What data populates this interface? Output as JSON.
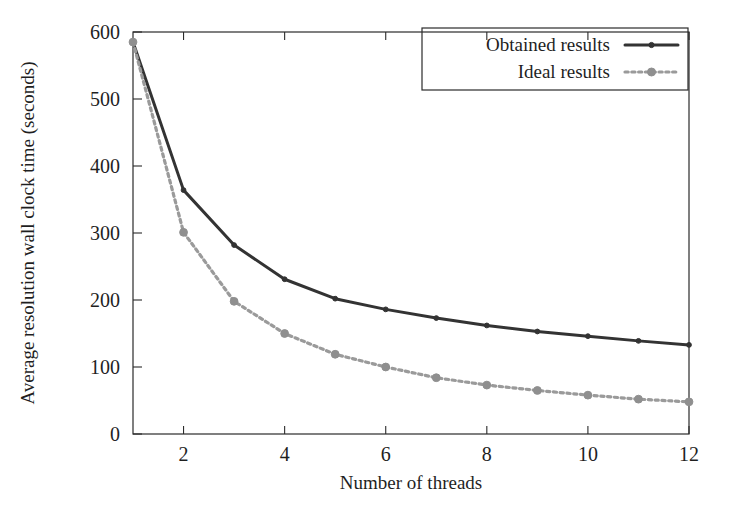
{
  "figure": {
    "background_color": "#ffffff",
    "frame_color": "#2b2b2b"
  },
  "chart_data": {
    "type": "line",
    "title": "",
    "xlabel": "Number of threads",
    "ylabel": "Average resolution wall clock time (seconds)",
    "x": [
      1,
      2,
      3,
      4,
      5,
      6,
      7,
      8,
      9,
      10,
      11,
      12
    ],
    "xlim": [
      1,
      12
    ],
    "ylim": [
      0,
      600
    ],
    "xticks": [
      2,
      4,
      6,
      8,
      10,
      12
    ],
    "xticklabels": [
      "2",
      "4",
      "6",
      "8",
      "10",
      "12"
    ],
    "yticks": [
      0,
      100,
      200,
      300,
      400,
      500,
      600
    ],
    "yticklabels": [
      "0",
      "100",
      "200",
      "300",
      "400",
      "500",
      "600"
    ],
    "grid": false,
    "legend_position": "top-right",
    "series": [
      {
        "name": "Obtained results",
        "style": "solid",
        "color": "#333333",
        "marker": "point",
        "values": [
          585,
          364,
          282,
          231,
          202,
          186,
          173,
          162,
          153,
          146,
          139,
          133
        ]
      },
      {
        "name": "Ideal results",
        "style": "dotted",
        "color": "#9a9a9a",
        "marker": "point",
        "values": [
          585,
          301,
          198,
          150,
          119,
          100,
          84,
          73,
          65,
          58,
          52,
          48
        ]
      }
    ]
  },
  "legend": {
    "items": [
      {
        "label": "Obtained results",
        "swatch": "solid-line-with-point"
      },
      {
        "label": "Ideal results",
        "swatch": "dotted-line-with-point"
      }
    ]
  },
  "axes": {
    "x_title": "Number of threads",
    "y_title": "Average resolution wall clock time (seconds)"
  }
}
